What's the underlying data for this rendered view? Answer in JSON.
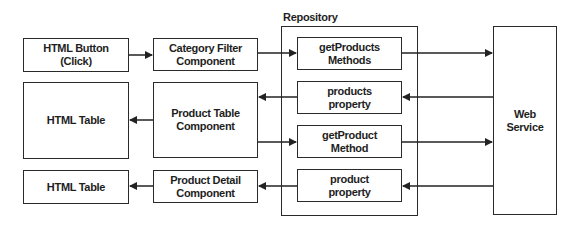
{
  "diagram": {
    "type": "architecture-flow",
    "line_color": "#222222",
    "container": {
      "label": "Repository"
    },
    "nodes": {
      "html_button": {
        "label": "HTML Button\n(Click)"
      },
      "category_filter": {
        "label": "Category Filter\nComponent"
      },
      "html_table_1": {
        "label": "HTML Table"
      },
      "product_table": {
        "label": "Product Table\nComponent"
      },
      "html_table_2": {
        "label": "HTML Table"
      },
      "product_detail": {
        "label": "Product Detail\nComponent"
      },
      "get_products": {
        "label": "getProducts\nMethods"
      },
      "products_property": {
        "label": "products\nproperty"
      },
      "get_product": {
        "label": "getProduct\nMethod"
      },
      "product_property": {
        "label": "product\nproperty"
      },
      "web_service": {
        "label": "Web\nService"
      }
    },
    "edges": [
      {
        "from": "HTML Button (Click)",
        "to": "Category Filter Component"
      },
      {
        "from": "Category Filter Component",
        "to": "getProducts Methods"
      },
      {
        "from": "getProducts Methods",
        "to": "Web Service"
      },
      {
        "from": "Web Service",
        "to": "products property"
      },
      {
        "from": "products property",
        "to": "Product Table Component"
      },
      {
        "from": "Product Table Component",
        "to": "HTML Table"
      },
      {
        "from": "Product Table Component",
        "to": "getProduct Method"
      },
      {
        "from": "getProduct Method",
        "to": "Web Service"
      },
      {
        "from": "Web Service",
        "to": "product property"
      },
      {
        "from": "product property",
        "to": "Product Detail Component"
      },
      {
        "from": "Product Detail Component",
        "to": "HTML Table"
      }
    ]
  }
}
